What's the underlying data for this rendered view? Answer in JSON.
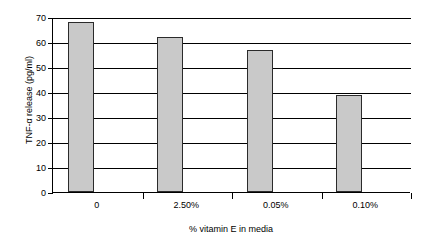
{
  "chart_data": {
    "type": "bar",
    "title": "",
    "subtitle": "",
    "categories": [
      "0",
      "2.50%",
      "0.05%",
      "0.10%"
    ],
    "values": [
      68,
      62,
      57,
      39
    ],
    "xlabel": "% vitamin E in media",
    "ylabel": "TNF-α release (pg/ml)",
    "ylim": [
      0,
      70
    ],
    "ytick_labels": [
      "0",
      "10",
      "20",
      "30",
      "40",
      "50",
      "60",
      "70"
    ],
    "ytick_values": [
      0,
      10,
      20,
      30,
      40,
      50,
      60,
      70
    ],
    "grid": true,
    "grid_axis": "y",
    "legend": false,
    "legend_position": "none",
    "series": [
      {
        "name": "TNF-α release",
        "values": [
          68,
          62,
          57,
          39
        ]
      }
    ],
    "colors": {
      "bar_fill": "#c9c9c9",
      "bar_border": "#2b2b2b",
      "gridline": "#000000",
      "axis": "#000000",
      "background": "#ffffff",
      "text": "#000000"
    }
  }
}
